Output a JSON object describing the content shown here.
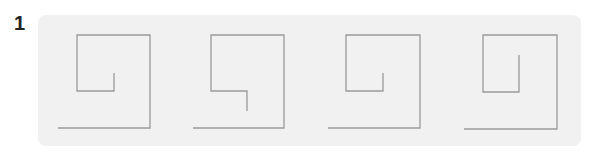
{
  "question": {
    "number": "1"
  },
  "style": {
    "panel_bg": "#f1f1f1",
    "line_color": "#9a9a9a",
    "label_color": "#222222"
  },
  "figures": [
    {
      "id": "figure-1",
      "points": "58,128 150,128 150,35 77,35 77,91 114,91 114,73"
    },
    {
      "id": "figure-2",
      "points": "193,128 284,128 284,35 211,35 211,91 247,91 247,111"
    },
    {
      "id": "figure-3",
      "points": "328,128 420,128 420,35 346,35 346,91 383,91 383,73"
    },
    {
      "id": "figure-4",
      "points": "464,129 557,129 557,35 483,35 483,92 519,92 519,55"
    }
  ]
}
